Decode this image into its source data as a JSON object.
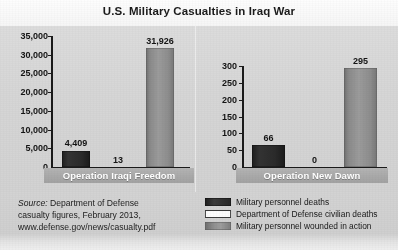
{
  "chart_data": {
    "type": "bar",
    "title": "U.S. Military Casualties in Iraq War",
    "xlabel": "",
    "ylabel": "",
    "grid": false,
    "legend_position": "bottom-right",
    "panels": [
      {
        "category": "Operation Iraqi Freedom",
        "ylim": [
          0,
          35000
        ],
        "yticks": [
          "0",
          "5,000",
          "10,000",
          "15,000",
          "20,000",
          "25,000",
          "30,000",
          "35,000"
        ],
        "ytick_values": [
          0,
          5000,
          10000,
          15000,
          20000,
          25000,
          30000,
          35000
        ],
        "bars": [
          {
            "series": "Military personnel deaths",
            "value": 4409,
            "label": "4,409",
            "color": "#2a2a2a"
          },
          {
            "series": "Department of Defense civilian deaths",
            "value": 13,
            "label": "13",
            "color": "#fbfbfb"
          },
          {
            "series": "Military personnel wounded in action",
            "value": 31926,
            "label": "31,926",
            "color": "#919191"
          }
        ]
      },
      {
        "category": "Operation New Dawn",
        "ylim": [
          0,
          300
        ],
        "yticks": [
          "0",
          "50",
          "100",
          "150",
          "200",
          "250",
          "300"
        ],
        "ytick_values": [
          0,
          50,
          100,
          150,
          200,
          250,
          300
        ],
        "bars": [
          {
            "series": "Military personnel deaths",
            "value": 66,
            "label": "66",
            "color": "#2a2a2a"
          },
          {
            "series": "Department of Defense civilian deaths",
            "value": 0,
            "label": "0",
            "color": "#fbfbfb"
          },
          {
            "series": "Military personnel wounded in action",
            "value": 295,
            "label": "295",
            "color": "#919191"
          }
        ]
      }
    ],
    "legend": [
      {
        "label": "Military personnel deaths",
        "color": "#2a2a2a"
      },
      {
        "label": "Department of Defense civilian deaths",
        "color": "#fcfcfc"
      },
      {
        "label": "Military personnel wounded in action",
        "color": "#919191"
      }
    ]
  },
  "source": {
    "prefix": "Source:",
    "line1_rest": " Department of Defense",
    "line2": "casualty figures, February 2013,",
    "line3": "www.defense.gov/news/casualty.pdf"
  }
}
